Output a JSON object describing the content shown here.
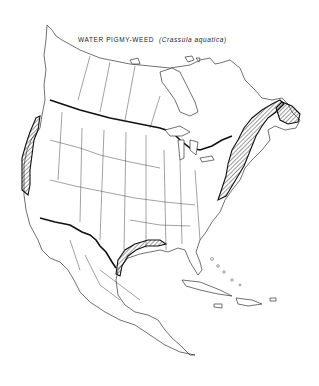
{
  "map": {
    "title_common": "WATER PIGMY-WEED",
    "title_scientific": "(Crassula aquatica)",
    "region": "North America",
    "range_pattern": "diagonal hatching",
    "range_areas": [
      "Pacific coast (British Columbia to California)",
      "Atlantic coast and Maritime Provinces (Newfoundland to New Jersey)",
      "Gulf of Mexico coast (Louisiana to Tamaulipas)"
    ],
    "colors": {
      "line": "#222222",
      "background": "#ffffff"
    }
  }
}
